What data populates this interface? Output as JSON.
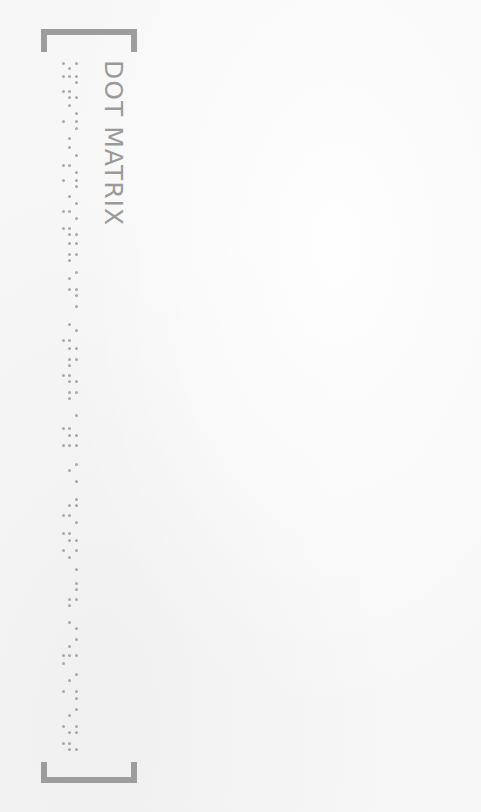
{
  "card": {
    "title": "DOT MATRIX",
    "colors": {
      "background": "#f7f7f7",
      "bracket": "#9d9d9d",
      "title": "#9a9a9a",
      "dot": "#a9a9a9"
    }
  },
  "braille": {
    "columns_x": {
      "L": 63,
      "M": 69,
      "R": 76
    },
    "rows": [
      {
        "y": 63,
        "dots": "LR"
      },
      {
        "y": 68,
        "dots": "M"
      },
      {
        "y": 76,
        "dots": "LMR"
      },
      {
        "y": 82,
        "dots": "R"
      },
      {
        "y": 91,
        "dots": "LM"
      },
      {
        "y": 97,
        "dots": "MR"
      },
      {
        "y": 105,
        "dots": "M"
      },
      {
        "y": 113,
        "dots": "R"
      },
      {
        "y": 121,
        "dots": "LR"
      },
      {
        "y": 128,
        "dots": "R"
      },
      {
        "y": 138,
        "dots": "M"
      },
      {
        "y": 147,
        "dots": "M"
      },
      {
        "y": 155,
        "dots": "R"
      },
      {
        "y": 165,
        "dots": "LM"
      },
      {
        "y": 172,
        "dots": "R"
      },
      {
        "y": 180,
        "dots": "LR"
      },
      {
        "y": 186,
        "dots": "R"
      },
      {
        "y": 196,
        "dots": "M"
      },
      {
        "y": 203,
        "dots": "R"
      },
      {
        "y": 211,
        "dots": "LM"
      },
      {
        "y": 218,
        "dots": "R"
      },
      {
        "y": 228,
        "dots": "LM"
      },
      {
        "y": 234,
        "dots": "MR"
      },
      {
        "y": 243,
        "dots": "MR"
      },
      {
        "y": 254,
        "dots": "MR"
      },
      {
        "y": 260,
        "dots": "M"
      },
      {
        "y": 272,
        "dots": "R"
      },
      {
        "y": 278,
        "dots": "M"
      },
      {
        "y": 289,
        "dots": "MR"
      },
      {
        "y": 295,
        "dots": "R"
      },
      {
        "y": 306,
        "dots": "R"
      },
      {
        "y": 324,
        "dots": "M"
      },
      {
        "y": 330,
        "dots": "R"
      },
      {
        "y": 340,
        "dots": "LM"
      },
      {
        "y": 348,
        "dots": "MR"
      },
      {
        "y": 359,
        "dots": "MR"
      },
      {
        "y": 365,
        "dots": "M"
      },
      {
        "y": 375,
        "dots": "LM"
      },
      {
        "y": 381,
        "dots": "MR"
      },
      {
        "y": 392,
        "dots": "MR"
      },
      {
        "y": 398,
        "dots": "M"
      },
      {
        "y": 415,
        "dots": "R"
      },
      {
        "y": 428,
        "dots": "LM"
      },
      {
        "y": 435,
        "dots": "MR"
      },
      {
        "y": 445,
        "dots": "LMR"
      },
      {
        "y": 464,
        "dots": "R"
      },
      {
        "y": 470,
        "dots": "M"
      },
      {
        "y": 481,
        "dots": "R"
      },
      {
        "y": 499,
        "dots": "R"
      },
      {
        "y": 505,
        "dots": "MR"
      },
      {
        "y": 515,
        "dots": "LM"
      },
      {
        "y": 522,
        "dots": "R"
      },
      {
        "y": 533,
        "dots": "LM"
      },
      {
        "y": 540,
        "dots": "MR"
      },
      {
        "y": 550,
        "dots": "LR"
      },
      {
        "y": 557,
        "dots": "M"
      },
      {
        "y": 569,
        "dots": "R"
      },
      {
        "y": 583,
        "dots": "R"
      },
      {
        "y": 589,
        "dots": "R"
      },
      {
        "y": 599,
        "dots": "MR"
      },
      {
        "y": 605,
        "dots": "M"
      },
      {
        "y": 622,
        "dots": "M"
      },
      {
        "y": 628,
        "dots": "R"
      },
      {
        "y": 639,
        "dots": "R"
      },
      {
        "y": 646,
        "dots": "M"
      },
      {
        "y": 655,
        "dots": "LMR"
      },
      {
        "y": 663,
        "dots": "L"
      },
      {
        "y": 674,
        "dots": "R"
      },
      {
        "y": 680,
        "dots": "M"
      },
      {
        "y": 691,
        "dots": "LR"
      },
      {
        "y": 698,
        "dots": "R"
      },
      {
        "y": 709,
        "dots": "R"
      },
      {
        "y": 715,
        "dots": "M"
      },
      {
        "y": 726,
        "dots": "LR"
      },
      {
        "y": 732,
        "dots": "MR"
      },
      {
        "y": 743,
        "dots": "LM"
      },
      {
        "y": 749,
        "dots": "MR"
      }
    ]
  }
}
